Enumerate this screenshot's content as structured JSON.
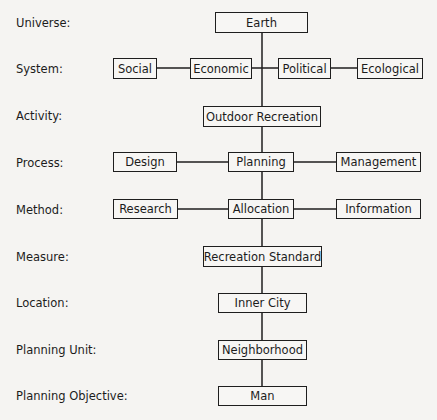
{
  "levels": [
    {
      "label": "Universe:",
      "y": 16
    },
    {
      "label": "System:",
      "y": 63
    },
    {
      "label": "Activity:",
      "y": 110
    },
    {
      "label": "Process:",
      "y": 157
    },
    {
      "label": "Method:",
      "y": 204
    },
    {
      "label": "Measure:",
      "y": 251
    },
    {
      "label": "Location:",
      "y": 297
    },
    {
      "label": "Planning Unit:",
      "y": 344
    },
    {
      "label": "Planning Objective:",
      "y": 390
    }
  ],
  "nodes": {
    "earth": "Earth",
    "social": "Social",
    "economic": "Economic",
    "political": "Political",
    "ecological": "Ecological",
    "outdoor_recreation": "Outdoor Recreation",
    "design": "Design",
    "planning": "Planning",
    "management": "Management",
    "research": "Research",
    "allocation": "Allocation",
    "information": "Information",
    "recreation_standard": "Recreation Standard",
    "inner_city": "Inner City",
    "neighborhood": "Neighborhood",
    "man": "Man"
  }
}
